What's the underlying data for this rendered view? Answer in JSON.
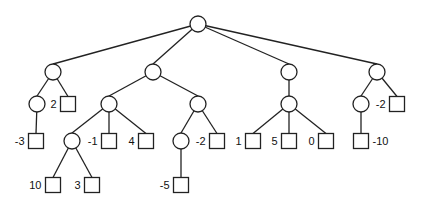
{
  "diagram": {
    "type": "game-tree",
    "nodes": [
      {
        "id": "root",
        "shape": "circle",
        "x": 198,
        "y": 24
      },
      {
        "id": "a",
        "shape": "circle",
        "x": 53,
        "y": 72,
        "parent": "root"
      },
      {
        "id": "b",
        "shape": "circle",
        "x": 153,
        "y": 72,
        "parent": "root"
      },
      {
        "id": "c",
        "shape": "circle",
        "x": 289,
        "y": 72,
        "parent": "root"
      },
      {
        "id": "d",
        "shape": "circle",
        "x": 377,
        "y": 72,
        "parent": "root"
      },
      {
        "id": "a1",
        "shape": "circle",
        "x": 37,
        "y": 104,
        "parent": "a"
      },
      {
        "id": "a2",
        "shape": "square",
        "x": 68,
        "y": 104,
        "parent": "a",
        "value": "2",
        "label_side": "left"
      },
      {
        "id": "a1a",
        "shape": "square",
        "x": 36,
        "y": 141,
        "parent": "a1",
        "value": "-3",
        "label_side": "left"
      },
      {
        "id": "b1",
        "shape": "circle",
        "x": 109,
        "y": 104,
        "parent": "b"
      },
      {
        "id": "b2",
        "shape": "circle",
        "x": 198,
        "y": 104,
        "parent": "b"
      },
      {
        "id": "b1a",
        "shape": "circle",
        "x": 72,
        "y": 141,
        "parent": "b1"
      },
      {
        "id": "b1b",
        "shape": "square",
        "x": 109,
        "y": 141,
        "parent": "b1",
        "value": "-1",
        "label_side": "left"
      },
      {
        "id": "b1c",
        "shape": "square",
        "x": 146,
        "y": 141,
        "parent": "b1",
        "value": "4",
        "label_side": "left"
      },
      {
        "id": "b1a1",
        "shape": "square",
        "x": 53,
        "y": 185,
        "parent": "b1a",
        "value": "10",
        "label_side": "left"
      },
      {
        "id": "b1a2",
        "shape": "square",
        "x": 92,
        "y": 185,
        "parent": "b1a",
        "value": "3",
        "label_side": "left"
      },
      {
        "id": "b2a",
        "shape": "circle",
        "x": 181,
        "y": 141,
        "parent": "b2"
      },
      {
        "id": "b2b",
        "shape": "square",
        "x": 217,
        "y": 141,
        "parent": "b2",
        "value": "-2",
        "label_side": "left"
      },
      {
        "id": "b2a1",
        "shape": "square",
        "x": 181,
        "y": 185,
        "parent": "b2a",
        "value": "-5",
        "label_side": "left"
      },
      {
        "id": "c1",
        "shape": "circle",
        "x": 289,
        "y": 104,
        "parent": "c"
      },
      {
        "id": "c1a",
        "shape": "square",
        "x": 253,
        "y": 141,
        "parent": "c1",
        "value": "1",
        "label_side": "left"
      },
      {
        "id": "c1b",
        "shape": "square",
        "x": 289,
        "y": 141,
        "parent": "c1",
        "value": "5",
        "label_side": "left"
      },
      {
        "id": "c1c",
        "shape": "square",
        "x": 326,
        "y": 141,
        "parent": "c1",
        "value": "0",
        "label_side": "left"
      },
      {
        "id": "d1",
        "shape": "circle",
        "x": 361,
        "y": 104,
        "parent": "d"
      },
      {
        "id": "d2",
        "shape": "square",
        "x": 397,
        "y": 104,
        "parent": "d",
        "value": "-2",
        "label_side": "left"
      },
      {
        "id": "d1a",
        "shape": "square",
        "x": 361,
        "y": 141,
        "parent": "d1",
        "value": "-10",
        "label_side": "right"
      }
    ]
  }
}
